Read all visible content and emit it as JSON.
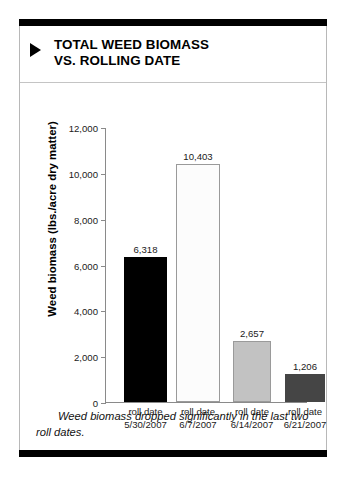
{
  "figure": {
    "title": "TOTAL WEED BIOMASS\nVS. ROLLING DATE",
    "bullet_icon": "triangle-right-icon",
    "caption": "Weed biomass dropped significantly in the last two roll dates."
  },
  "chart_data": {
    "type": "bar",
    "title": "TOTAL WEED BIOMASS VS. ROLLING DATE",
    "xlabel": "",
    "ylabel": "Weed biomass (lbs./acre dry matter)",
    "ylim": [
      0,
      12000
    ],
    "ytick_labels": [
      "12,000",
      "10,000",
      "8,000",
      "6,000",
      "4,000",
      "2,000",
      "0"
    ],
    "ytick_values": [
      12000,
      10000,
      8000,
      6000,
      4000,
      2000,
      0
    ],
    "grid": false,
    "legend": "none",
    "categories": [
      "roll date\n5/30/2007",
      "roll date\n6/7/2007",
      "roll date\n6/14/2007",
      "roll date\n6/21/2007"
    ],
    "values": [
      6318,
      10403,
      2657,
      1206
    ],
    "value_labels": [
      "6,318",
      "10,403",
      "2,657",
      "1,206"
    ],
    "bar_colors": [
      "#000000",
      "#fcfcfc",
      "#c2c2c2",
      "#454545"
    ],
    "bar_border_colors": [
      "#000000",
      "#9a9a9a",
      "#9a9a9a",
      "#454545"
    ]
  }
}
